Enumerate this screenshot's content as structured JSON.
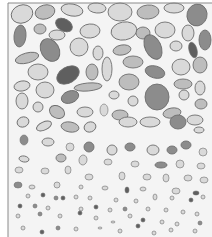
{
  "diagram": {
    "frame": {
      "x": 8,
      "y": 3,
      "width": 204,
      "height": 234,
      "stroke": "#8a8a8a",
      "background": "#f4f4f4"
    },
    "colors": {
      "light": "#d9d9d9",
      "mid": "#bdbdbd",
      "dark": "#8c8c8c",
      "darkest": "#5f5f5f",
      "outline": "#6e6e6e"
    },
    "layers": [
      {
        "name": "coarse-top",
        "y_range": [
          3,
          60
        ]
      },
      {
        "name": "coarse-mid",
        "y_range": [
          60,
          125
        ]
      },
      {
        "name": "medium",
        "y_range": [
          125,
          175
        ]
      },
      {
        "name": "fine",
        "y_range": [
          175,
          205
        ]
      },
      {
        "name": "very-fine",
        "y_range": [
          205,
          237
        ]
      }
    ],
    "grains": [
      {
        "x": 22,
        "y": 14,
        "rx": 11,
        "ry": 9,
        "r": -20,
        "c": "light"
      },
      {
        "x": 45,
        "y": 12,
        "rx": 10,
        "ry": 7,
        "r": -15,
        "c": "mid"
      },
      {
        "x": 72,
        "y": 10,
        "rx": 11,
        "ry": 6,
        "r": 10,
        "c": "light"
      },
      {
        "x": 97,
        "y": 8,
        "rx": 9,
        "ry": 5,
        "r": 5,
        "c": "light"
      },
      {
        "x": 120,
        "y": 12,
        "rx": 12,
        "ry": 9,
        "r": 0,
        "c": "light"
      },
      {
        "x": 148,
        "y": 12,
        "rx": 11,
        "ry": 7,
        "r": -5,
        "c": "mid"
      },
      {
        "x": 174,
        "y": 8,
        "rx": 10,
        "ry": 5,
        "r": 0,
        "c": "light"
      },
      {
        "x": 197,
        "y": 15,
        "rx": 10,
        "ry": 11,
        "r": 15,
        "c": "dark"
      },
      {
        "x": 20,
        "y": 36,
        "rx": 6,
        "ry": 11,
        "r": 5,
        "c": "dark"
      },
      {
        "x": 40,
        "y": 29,
        "rx": 6,
        "ry": 5,
        "r": 0,
        "c": "mid"
      },
      {
        "x": 64,
        "y": 25,
        "rx": 9,
        "ry": 6,
        "r": 30,
        "c": "darkest"
      },
      {
        "x": 57,
        "y": 35,
        "rx": 8,
        "ry": 5,
        "r": 0,
        "c": "light"
      },
      {
        "x": 90,
        "y": 31,
        "rx": 10,
        "ry": 7,
        "r": -5,
        "c": "light"
      },
      {
        "x": 124,
        "y": 31,
        "rx": 13,
        "ry": 9,
        "r": -10,
        "c": "light"
      },
      {
        "x": 143,
        "y": 33,
        "rx": 7,
        "ry": 6,
        "r": 0,
        "c": "mid"
      },
      {
        "x": 165,
        "y": 30,
        "rx": 10,
        "ry": 8,
        "r": 0,
        "c": "light"
      },
      {
        "x": 188,
        "y": 33,
        "rx": 6,
        "ry": 8,
        "r": 0,
        "c": "light"
      },
      {
        "x": 205,
        "y": 40,
        "rx": 6,
        "ry": 10,
        "r": 0,
        "c": "dark"
      },
      {
        "x": 50,
        "y": 50,
        "rx": 9,
        "ry": 12,
        "r": -30,
        "c": "dark"
      },
      {
        "x": 79,
        "y": 47,
        "rx": 9,
        "ry": 9,
        "r": 0,
        "c": "light"
      },
      {
        "x": 27,
        "y": 58,
        "rx": 12,
        "ry": 5,
        "r": -15,
        "c": "mid"
      },
      {
        "x": 98,
        "y": 53,
        "rx": 5,
        "ry": 7,
        "r": 0,
        "c": "light"
      },
      {
        "x": 122,
        "y": 50,
        "rx": 9,
        "ry": 5,
        "r": -10,
        "c": "mid"
      },
      {
        "x": 153,
        "y": 47,
        "rx": 8,
        "ry": 13,
        "r": -25,
        "c": "dark"
      },
      {
        "x": 176,
        "y": 46,
        "rx": 6,
        "ry": 5,
        "r": 0,
        "c": "light"
      },
      {
        "x": 193,
        "y": 50,
        "rx": 4,
        "ry": 8,
        "r": -15,
        "c": "darkest"
      },
      {
        "x": 68,
        "y": 75,
        "rx": 12,
        "ry": 8,
        "r": -30,
        "c": "darkest"
      },
      {
        "x": 38,
        "y": 72,
        "rx": 10,
        "ry": 8,
        "r": 0,
        "c": "light"
      },
      {
        "x": 92,
        "y": 72,
        "rx": 6,
        "ry": 8,
        "r": 0,
        "c": "mid"
      },
      {
        "x": 107,
        "y": 69,
        "rx": 5,
        "ry": 12,
        "r": 0,
        "c": "light"
      },
      {
        "x": 133,
        "y": 62,
        "rx": 10,
        "ry": 6,
        "r": 0,
        "c": "mid"
      },
      {
        "x": 155,
        "y": 72,
        "rx": 10,
        "ry": 6,
        "r": 15,
        "c": "dark"
      },
      {
        "x": 181,
        "y": 67,
        "rx": 9,
        "ry": 8,
        "r": 0,
        "c": "light"
      },
      {
        "x": 200,
        "y": 65,
        "rx": 7,
        "ry": 8,
        "r": 0,
        "c": "mid"
      },
      {
        "x": 22,
        "y": 86,
        "rx": 8,
        "ry": 5,
        "r": -10,
        "c": "light"
      },
      {
        "x": 45,
        "y": 90,
        "rx": 9,
        "ry": 8,
        "r": 0,
        "c": "light"
      },
      {
        "x": 88,
        "y": 87,
        "rx": 14,
        "ry": 4,
        "r": -5,
        "c": "mid"
      },
      {
        "x": 129,
        "y": 82,
        "rx": 10,
        "ry": 8,
        "r": 0,
        "c": "mid"
      },
      {
        "x": 157,
        "y": 97,
        "rx": 12,
        "ry": 13,
        "r": 0,
        "c": "dark"
      },
      {
        "x": 183,
        "y": 84,
        "rx": 9,
        "ry": 5,
        "r": 0,
        "c": "mid"
      },
      {
        "x": 200,
        "y": 88,
        "rx": 5,
        "ry": 7,
        "r": 0,
        "c": "light"
      },
      {
        "x": 22,
        "y": 101,
        "rx": 6,
        "ry": 8,
        "r": 0,
        "c": "light"
      },
      {
        "x": 70,
        "y": 97,
        "rx": 9,
        "ry": 6,
        "r": -20,
        "c": "dark"
      },
      {
        "x": 114,
        "y": 95,
        "rx": 5,
        "ry": 4,
        "r": 0,
        "c": "light"
      },
      {
        "x": 133,
        "y": 101,
        "rx": 5,
        "ry": 5,
        "r": 0,
        "c": "light"
      },
      {
        "x": 184,
        "y": 95,
        "rx": 5,
        "ry": 5,
        "r": 0,
        "c": "light"
      },
      {
        "x": 201,
        "y": 104,
        "rx": 6,
        "ry": 5,
        "r": 0,
        "c": "mid"
      },
      {
        "x": 38,
        "y": 107,
        "rx": 5,
        "ry": 5,
        "r": 0,
        "c": "light"
      },
      {
        "x": 57,
        "y": 112,
        "rx": 8,
        "ry": 6,
        "r": 30,
        "c": "mid"
      },
      {
        "x": 85,
        "y": 112,
        "rx": 8,
        "ry": 5,
        "r": 0,
        "c": "light"
      },
      {
        "x": 104,
        "y": 110,
        "rx": 4,
        "ry": 6,
        "r": 0,
        "c": "light"
      },
      {
        "x": 120,
        "y": 115,
        "rx": 8,
        "ry": 5,
        "r": 0,
        "c": "mid"
      },
      {
        "x": 172,
        "y": 113,
        "rx": 9,
        "ry": 5,
        "r": -10,
        "c": "mid"
      },
      {
        "x": 195,
        "y": 120,
        "rx": 8,
        "ry": 5,
        "r": 0,
        "c": "light"
      },
      {
        "x": 23,
        "y": 122,
        "rx": 6,
        "ry": 5,
        "r": -20,
        "c": "light"
      },
      {
        "x": 44,
        "y": 126,
        "rx": 8,
        "ry": 4,
        "r": -25,
        "c": "light"
      },
      {
        "x": 70,
        "y": 127,
        "rx": 9,
        "ry": 5,
        "r": 10,
        "c": "mid"
      },
      {
        "x": 90,
        "y": 127,
        "rx": 6,
        "ry": 5,
        "r": -20,
        "c": "light"
      },
      {
        "x": 128,
        "y": 122,
        "rx": 9,
        "ry": 5,
        "r": 0,
        "c": "light"
      },
      {
        "x": 150,
        "y": 122,
        "rx": 10,
        "ry": 5,
        "r": 0,
        "c": "light"
      },
      {
        "x": 178,
        "y": 122,
        "rx": 8,
        "ry": 7,
        "r": 0,
        "c": "dark"
      },
      {
        "x": 199,
        "y": 130,
        "rx": 5,
        "ry": 3,
        "r": 0,
        "c": "light"
      },
      {
        "x": 24,
        "y": 140,
        "rx": 4,
        "ry": 5,
        "r": 0,
        "c": "dark"
      },
      {
        "x": 48,
        "y": 142,
        "rx": 6,
        "ry": 4,
        "r": 0,
        "c": "light"
      },
      {
        "x": 70,
        "y": 147,
        "rx": 4,
        "ry": 4,
        "r": 0,
        "c": "light"
      },
      {
        "x": 89,
        "y": 147,
        "rx": 5,
        "ry": 5,
        "r": 0,
        "c": "dark"
      },
      {
        "x": 112,
        "y": 150,
        "rx": 5,
        "ry": 5,
        "r": 0,
        "c": "light"
      },
      {
        "x": 130,
        "y": 147,
        "rx": 5,
        "ry": 4,
        "r": 0,
        "c": "dark"
      },
      {
        "x": 153,
        "y": 150,
        "rx": 6,
        "ry": 5,
        "r": 0,
        "c": "light"
      },
      {
        "x": 172,
        "y": 150,
        "rx": 5,
        "ry": 4,
        "r": 0,
        "c": "dark"
      },
      {
        "x": 186,
        "y": 145,
        "rx": 5,
        "ry": 4,
        "r": 0,
        "c": "dark"
      },
      {
        "x": 203,
        "y": 152,
        "rx": 4,
        "ry": 4,
        "r": 0,
        "c": "light"
      },
      {
        "x": 24,
        "y": 159,
        "rx": 5,
        "ry": 3,
        "r": 10,
        "c": "light"
      },
      {
        "x": 61,
        "y": 158,
        "rx": 5,
        "ry": 4,
        "r": 0,
        "c": "mid"
      },
      {
        "x": 83,
        "y": 160,
        "rx": 4,
        "ry": 5,
        "r": 10,
        "c": "light"
      },
      {
        "x": 108,
        "y": 162,
        "rx": 4,
        "ry": 3,
        "r": 0,
        "c": "light"
      },
      {
        "x": 135,
        "y": 164,
        "rx": 4,
        "ry": 3,
        "r": 0,
        "c": "light"
      },
      {
        "x": 161,
        "y": 165,
        "rx": 6,
        "ry": 3,
        "r": 0,
        "c": "dark"
      },
      {
        "x": 180,
        "y": 164,
        "rx": 4,
        "ry": 4,
        "r": 0,
        "c": "light"
      },
      {
        "x": 201,
        "y": 166,
        "rx": 4,
        "ry": 3,
        "r": 0,
        "c": "light"
      },
      {
        "x": 19,
        "y": 170,
        "rx": 4,
        "ry": 3,
        "r": 0,
        "c": "light"
      },
      {
        "x": 45,
        "y": 171,
        "rx": 4,
        "ry": 3,
        "r": 0,
        "c": "light"
      },
      {
        "x": 68,
        "y": 170,
        "rx": 3,
        "ry": 4,
        "r": 0,
        "c": "light"
      },
      {
        "x": 89,
        "y": 177,
        "rx": 4,
        "ry": 3,
        "r": 0,
        "c": "light"
      },
      {
        "x": 122,
        "y": 176,
        "rx": 3,
        "ry": 4,
        "r": 0,
        "c": "light"
      },
      {
        "x": 147,
        "y": 177,
        "rx": 4,
        "ry": 3,
        "r": 0,
        "c": "light"
      },
      {
        "x": 166,
        "y": 178,
        "rx": 3,
        "ry": 4,
        "r": 0,
        "c": "light"
      },
      {
        "x": 188,
        "y": 178,
        "rx": 4,
        "ry": 3,
        "r": 0,
        "c": "light"
      },
      {
        "x": 204,
        "y": 180,
        "rx": 4,
        "ry": 3,
        "r": 0,
        "c": "light"
      },
      {
        "x": 18,
        "y": 185,
        "rx": 4,
        "ry": 3,
        "r": 0,
        "c": "dark"
      },
      {
        "x": 32,
        "y": 187,
        "rx": 3,
        "ry": 2,
        "r": 0,
        "c": "light"
      },
      {
        "x": 57,
        "y": 185,
        "rx": 3,
        "ry": 3,
        "r": 0,
        "c": "light"
      },
      {
        "x": 81,
        "y": 187,
        "rx": 2,
        "ry": 2,
        "r": 0,
        "c": "light"
      },
      {
        "x": 105,
        "y": 188,
        "rx": 3,
        "ry": 2,
        "r": 0,
        "c": "light"
      },
      {
        "x": 127,
        "y": 190,
        "rx": 2,
        "ry": 3,
        "r": 0,
        "c": "darkest"
      },
      {
        "x": 143,
        "y": 189,
        "rx": 3,
        "ry": 2,
        "r": 0,
        "c": "light"
      },
      {
        "x": 176,
        "y": 191,
        "rx": 4,
        "ry": 3,
        "r": 0,
        "c": "light"
      },
      {
        "x": 196,
        "y": 193,
        "rx": 3,
        "ry": 2,
        "r": 0,
        "c": "darkest"
      },
      {
        "x": 28,
        "y": 196,
        "rx": 2,
        "ry": 2,
        "r": 0,
        "c": "light"
      },
      {
        "x": 43,
        "y": 195,
        "rx": 2,
        "ry": 2,
        "r": 0,
        "c": "darkest"
      },
      {
        "x": 56,
        "y": 198,
        "rx": 2,
        "ry": 2,
        "r": 0,
        "c": "dark"
      },
      {
        "x": 63,
        "y": 198,
        "rx": 2,
        "ry": 2,
        "r": 0,
        "c": "darkest"
      },
      {
        "x": 76,
        "y": 197,
        "rx": 2,
        "ry": 2,
        "r": 0,
        "c": "light"
      },
      {
        "x": 90,
        "y": 198,
        "rx": 2,
        "ry": 2,
        "r": 0,
        "c": "light"
      },
      {
        "x": 116,
        "y": 200,
        "rx": 2,
        "ry": 2,
        "r": 0,
        "c": "light"
      },
      {
        "x": 136,
        "y": 201,
        "rx": 2,
        "ry": 2,
        "r": 0,
        "c": "light"
      },
      {
        "x": 155,
        "y": 197,
        "rx": 2,
        "ry": 3,
        "r": 0,
        "c": "light"
      },
      {
        "x": 172,
        "y": 198,
        "rx": 2,
        "ry": 2,
        "r": 0,
        "c": "light"
      },
      {
        "x": 191,
        "y": 200,
        "rx": 2,
        "ry": 2,
        "r": 0,
        "c": "darkest"
      },
      {
        "x": 203,
        "y": 197,
        "rx": 2,
        "ry": 2,
        "r": 0,
        "c": "light"
      },
      {
        "x": 20,
        "y": 206,
        "rx": 2,
        "ry": 2,
        "r": 0,
        "c": "darkest"
      },
      {
        "x": 35,
        "y": 206,
        "rx": 2,
        "ry": 2,
        "r": 0,
        "c": "dark"
      },
      {
        "x": 48,
        "y": 208,
        "rx": 2,
        "ry": 2,
        "r": 0,
        "c": "light"
      },
      {
        "x": 81,
        "y": 209,
        "rx": 2,
        "ry": 2,
        "r": 0,
        "c": "light"
      },
      {
        "x": 96,
        "y": 207,
        "rx": 2,
        "ry": 2,
        "r": 0,
        "c": "darkest"
      },
      {
        "x": 110,
        "y": 210,
        "rx": 2,
        "ry": 2,
        "r": 0,
        "c": "light"
      },
      {
        "x": 125,
        "y": 209,
        "rx": 2,
        "ry": 2,
        "r": 0,
        "c": "dark"
      },
      {
        "x": 148,
        "y": 209,
        "rx": 2,
        "ry": 2,
        "r": 0,
        "c": "light"
      },
      {
        "x": 166,
        "y": 210,
        "rx": 2,
        "ry": 2,
        "r": 0,
        "c": "light"
      },
      {
        "x": 183,
        "y": 212,
        "rx": 2,
        "ry": 2,
        "r": 0,
        "c": "light"
      },
      {
        "x": 197,
        "y": 214,
        "rx": 2,
        "ry": 2,
        "r": 0,
        "c": "light"
      },
      {
        "x": 18,
        "y": 216,
        "rx": 2,
        "ry": 2,
        "r": 0,
        "c": "light"
      },
      {
        "x": 40,
        "y": 214,
        "rx": 2,
        "ry": 2,
        "r": 0,
        "c": "dark"
      },
      {
        "x": 60,
        "y": 216,
        "rx": 2,
        "ry": 2,
        "r": 0,
        "c": "light"
      },
      {
        "x": 80,
        "y": 213,
        "rx": 2,
        "ry": 2,
        "r": 0,
        "c": "darkest"
      },
      {
        "x": 96,
        "y": 218,
        "rx": 2,
        "ry": 2,
        "r": 0,
        "c": "light"
      },
      {
        "x": 113,
        "y": 222,
        "rx": 2,
        "ry": 1,
        "r": 0,
        "c": "light"
      },
      {
        "x": 130,
        "y": 216,
        "rx": 2,
        "ry": 2,
        "r": 0,
        "c": "light"
      },
      {
        "x": 143,
        "y": 220,
        "rx": 2,
        "ry": 2,
        "r": 0,
        "c": "darkest"
      },
      {
        "x": 162,
        "y": 222,
        "rx": 2,
        "ry": 2,
        "r": 0,
        "c": "light"
      },
      {
        "x": 177,
        "y": 224,
        "rx": 2,
        "ry": 2,
        "r": 0,
        "c": "light"
      },
      {
        "x": 200,
        "y": 223,
        "rx": 2,
        "ry": 2,
        "r": 0,
        "c": "dark"
      },
      {
        "x": 23,
        "y": 228,
        "rx": 2,
        "ry": 2,
        "r": 0,
        "c": "light"
      },
      {
        "x": 42,
        "y": 232,
        "rx": 2,
        "ry": 2,
        "r": 0,
        "c": "darkest"
      },
      {
        "x": 58,
        "y": 228,
        "rx": 2,
        "ry": 2,
        "r": 0,
        "c": "dark"
      },
      {
        "x": 76,
        "y": 229,
        "rx": 2,
        "ry": 2,
        "r": 0,
        "c": "light"
      },
      {
        "x": 100,
        "y": 228,
        "rx": 2,
        "ry": 1,
        "r": 0,
        "c": "light"
      },
      {
        "x": 120,
        "y": 231,
        "rx": 2,
        "ry": 2,
        "r": 0,
        "c": "light"
      },
      {
        "x": 138,
        "y": 226,
        "rx": 2,
        "ry": 2,
        "r": 0,
        "c": "darkest"
      },
      {
        "x": 154,
        "y": 233,
        "rx": 2,
        "ry": 2,
        "r": 0,
        "c": "light"
      },
      {
        "x": 171,
        "y": 230,
        "rx": 2,
        "ry": 2,
        "r": 0,
        "c": "light"
      },
      {
        "x": 195,
        "y": 231,
        "rx": 2,
        "ry": 2,
        "r": 0,
        "c": "light"
      }
    ]
  }
}
